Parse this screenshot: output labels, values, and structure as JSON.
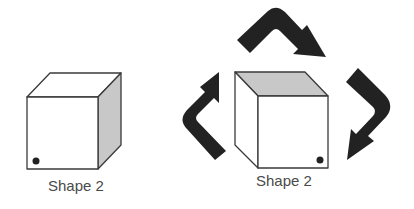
{
  "colors": {
    "background": "#ffffff",
    "outline": "#3a3a3a",
    "shaded_face": "#c8c8c8",
    "arrow": "#222222",
    "dot": "#222222",
    "label_text": "#4a4a4a"
  },
  "shapes": [
    {
      "label": "Shape 2",
      "shaded_face": "right-side",
      "dot_position": "bottom-left"
    },
    {
      "label": "Shape 2",
      "shaded_face": "top",
      "dot_position": "bottom-right"
    }
  ],
  "arrows": [
    {
      "icon": "curved-arrow-left-icon",
      "direction": "up-right"
    },
    {
      "icon": "curved-arrow-top-icon",
      "direction": "right-down"
    },
    {
      "icon": "curved-arrow-right-icon",
      "direction": "down-left"
    }
  ]
}
